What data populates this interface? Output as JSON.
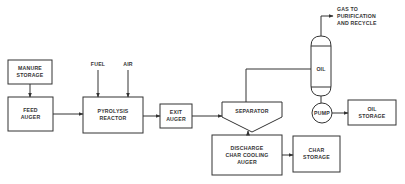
{
  "diagram": {
    "type": "process-flow",
    "nodes": {
      "manure_storage": {
        "line1": "MANURE",
        "line2": "STORAGE"
      },
      "feed_auger": {
        "line1": "FEED",
        "line2": "AUGER"
      },
      "pyrolysis_reactor": {
        "line1": "PYROLYSIS",
        "line2": "REACTOR"
      },
      "exit_auger": {
        "line1": "EXIT",
        "line2": "AUGER"
      },
      "separator": {
        "label": "SEPARATOR"
      },
      "discharge": {
        "line1": "DISCHARGE",
        "line2": "CHAR COOLING",
        "line3": "AUGER"
      },
      "char_storage": {
        "line1": "CHAR",
        "line2": "STORAGE"
      },
      "oil_vessel": {
        "label": "OIL"
      },
      "pump": {
        "label": "PUMP"
      },
      "oil_storage": {
        "line1": "OIL",
        "line2": "STORAGE"
      }
    },
    "inputs": {
      "fuel": "FUEL",
      "air": "AIR"
    },
    "outputs": {
      "gas": {
        "line1": "GAS TO",
        "line2": "PURIFICATION",
        "line3": "AND RECYCLE"
      }
    },
    "edges": [
      [
        "manure_storage",
        "feed_auger"
      ],
      [
        "feed_auger",
        "pyrolysis_reactor"
      ],
      [
        "fuel",
        "pyrolysis_reactor"
      ],
      [
        "air",
        "pyrolysis_reactor"
      ],
      [
        "pyrolysis_reactor",
        "exit_auger"
      ],
      [
        "exit_auger",
        "separator"
      ],
      [
        "separator",
        "oil_vessel"
      ],
      [
        "separator",
        "discharge"
      ],
      [
        "discharge",
        "char_storage"
      ],
      [
        "oil_vessel",
        "gas"
      ],
      [
        "oil_vessel",
        "pump"
      ],
      [
        "pump",
        "oil_storage"
      ]
    ]
  }
}
